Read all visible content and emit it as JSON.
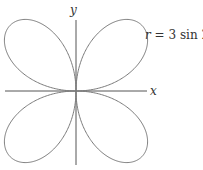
{
  "chart_data": {
    "type": "line",
    "subtype": "polar-rose",
    "equation": "r = 3 sin 2θ",
    "label": "r = 3 sin 2θ",
    "xlabel": "x",
    "ylabel": "y",
    "amplitude": 3,
    "k": 2,
    "petals": 4,
    "grid": false,
    "legend": "none",
    "colors": {
      "curve": "#7a7a7a",
      "axis": "#555555",
      "text": "#333333"
    }
  },
  "labels": {
    "x_axis": "x",
    "y_axis": "y",
    "equation_r": "r",
    "equation_rest": " = 3 sin 2θ"
  }
}
